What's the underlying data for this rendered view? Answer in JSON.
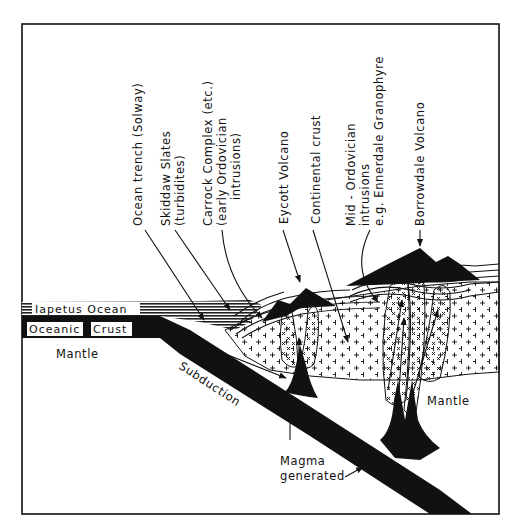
{
  "diagram": {
    "colors": {
      "ink": "#111111",
      "paper": "#ffffff"
    },
    "labels": {
      "ocean_trench": "Ocean  trench (Solway)",
      "skiddaw_1": "Skiddaw  Slates",
      "skiddaw_2": "(turbidites)",
      "carrock_1": "Carrock  Complex  (etc.)",
      "carrock_2": "(early Ordovician",
      "carrock_3": "intrusions)",
      "eycott": "Eycott  Volcano",
      "continental": "Continental  crust",
      "midord_1": "Mid - Ordovician",
      "midord_2": "intrusions",
      "midord_3": "e.g. Ennerdale  Granophyre",
      "borrowdale": "Borrowdale  Volcano",
      "iapetus": "Iapetus  Ocean",
      "oceanic": "Oceanic",
      "crust": "Crust",
      "mantle_left": "Mantle",
      "mantle_right": "Mantle",
      "subduction": "Subduction",
      "magma_1": "Magma",
      "magma_2": "generated"
    }
  }
}
